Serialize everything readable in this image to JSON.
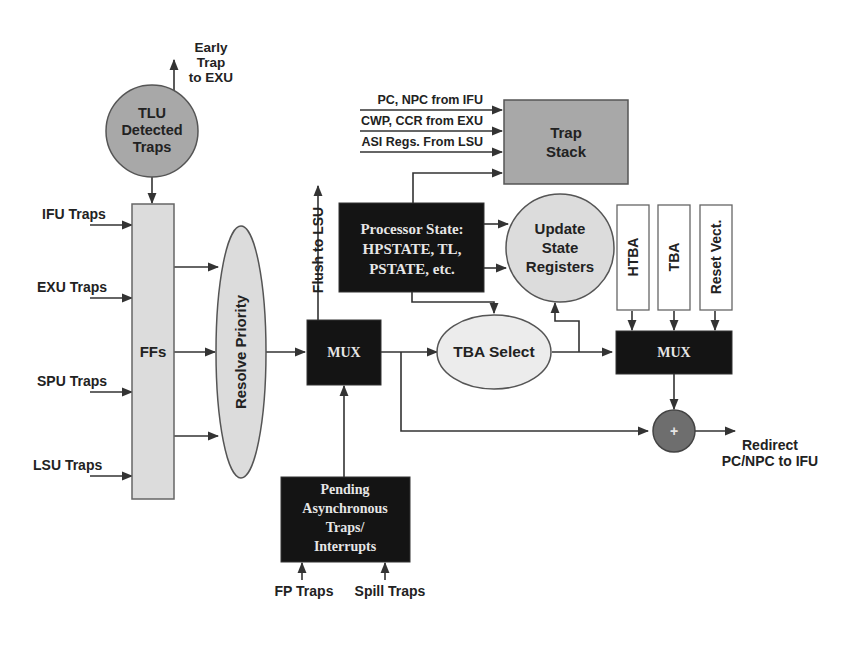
{
  "colors": {
    "background": "#ffffff",
    "line": "#333333",
    "light_fill": "#dcdcdc",
    "medium_fill": "#a8a8a8",
    "dark_fill": "#141414",
    "adder_fill": "#6e6e6e",
    "dark_text": "#e6e6e6",
    "text": "#222222"
  },
  "nodes": {
    "tlu_detected": {
      "line1": "TLU",
      "line2": "Detected",
      "line3": "Traps"
    },
    "early_trap": {
      "line1": "Early",
      "line2": "Trap",
      "line3": "to EXU"
    },
    "ffs": {
      "label": "FFs"
    },
    "resolve_priority": {
      "label": "Resolve Priority"
    },
    "mux1": {
      "label": "MUX"
    },
    "flush": {
      "label": "Flush to LSU"
    },
    "processor_state": {
      "line1": "Processor State:",
      "line2": "HPSTATE, TL,",
      "line3": "PSTATE, etc."
    },
    "trap_stack": {
      "line1": "Trap",
      "line2": "Stack"
    },
    "update_state": {
      "line1": "Update",
      "line2": "State",
      "line3": "Registers"
    },
    "tba_select": {
      "label": "TBA Select"
    },
    "htba": {
      "label": "HTBA"
    },
    "tba": {
      "label": "TBA"
    },
    "reset_vect": {
      "label": "Reset Vect."
    },
    "mux2": {
      "label": "MUX"
    },
    "adder": {
      "label": "+"
    },
    "redirect": {
      "line1": "Redirect",
      "line2": "PC/NPC to IFU"
    },
    "pending": {
      "line1": "Pending",
      "line2": "Asynchronous",
      "line3": "Traps/",
      "line4": "Interrupts"
    }
  },
  "inputs": {
    "unit_traps": [
      "IFU Traps",
      "EXU Traps",
      "SPU Traps",
      "LSU Traps"
    ],
    "trap_stack_inputs": [
      "PC, NPC from IFU",
      "CWP, CCR from EXU",
      "ASI Regs. From LSU"
    ],
    "pending_inputs": [
      "FP Traps",
      "Spill Traps"
    ]
  }
}
